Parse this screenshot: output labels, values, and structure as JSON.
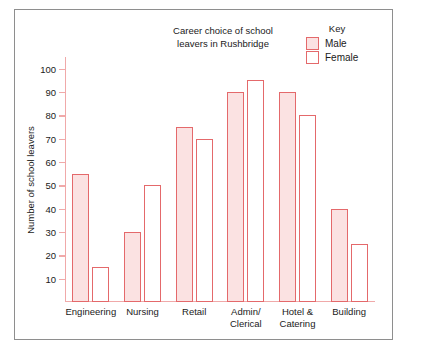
{
  "chart_data": {
    "type": "bar",
    "title": "Career choice of school leavers in Rushbridge",
    "title_line1": "Career choice of school",
    "title_line2": "leavers in Rushbridge",
    "xlabel": "",
    "ylabel": "Number of school leavers",
    "ylim": [
      0,
      105
    ],
    "ytick_step": 10,
    "yticks": [
      10,
      20,
      30,
      40,
      50,
      60,
      70,
      80,
      90,
      100
    ],
    "grid": false,
    "legend_position": "top-right",
    "legend_title": "Key",
    "categories": [
      "Engineering",
      "Nursing",
      "Retail",
      "Admin/ Clerical",
      "Hotel & Catering",
      "Building"
    ],
    "category_lines": [
      [
        "Engineering"
      ],
      [
        "Nursing"
      ],
      [
        "Retail"
      ],
      [
        "Admin/",
        "Clerical"
      ],
      [
        "Hotel &",
        "Catering"
      ],
      [
        "Building"
      ]
    ],
    "series": [
      {
        "name": "Male",
        "color": "#fbe2e2",
        "stroke": "#e4696b",
        "values": [
          55,
          30,
          75,
          90,
          90,
          40
        ]
      },
      {
        "name": "Female",
        "color": "#ffffff",
        "stroke": "#e4696b",
        "values": [
          15,
          50,
          70,
          95,
          80,
          25
        ]
      }
    ]
  },
  "colors": {
    "bar_stroke": "#e4696b",
    "male_fill": "#fbe2e2",
    "female_fill": "#ffffff",
    "axis": "#f0a9a9",
    "frame": "#8e8e8e",
    "text": "#1a1a1a"
  }
}
